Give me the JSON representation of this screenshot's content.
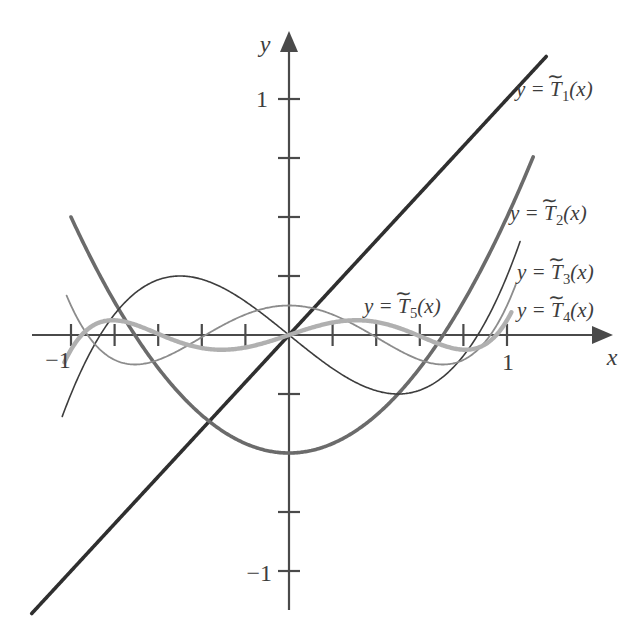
{
  "chart_data": {
    "type": "line",
    "title": "",
    "xlabel": "x",
    "ylabel": "y",
    "xlim": [
      -1.18,
      1.42
    ],
    "ylim": [
      -1.25,
      1.25
    ],
    "grid": false,
    "legend_position": "inline-right",
    "x_ticks": [
      -1,
      -0.8,
      -0.6,
      -0.4,
      -0.2,
      0.2,
      0.4,
      0.6,
      0.8,
      1
    ],
    "x_tick_labels": [
      "-1",
      "",
      "",
      "",
      "",
      "",
      "",
      "",
      "",
      "1"
    ],
    "y_ticks": [
      -1,
      -0.75,
      -0.5,
      -0.25,
      0.25,
      0.5,
      0.75,
      1
    ],
    "y_tick_labels": [
      "−1",
      "",
      "",
      "",
      "",
      "",
      "",
      "1"
    ],
    "series": [
      {
        "name": "T1",
        "label": "y = T̃1(x)",
        "formula": "x",
        "color": "#2f2f2f",
        "width": 3.6,
        "domain": [
          -1.18,
          1.18
        ]
      },
      {
        "name": "T2",
        "label": "y = T̃2(x)",
        "formula": "x^2 - 1/2",
        "color": "#6b6b6b",
        "width": 3.6,
        "domain": [
          -1,
          1.12
        ]
      },
      {
        "name": "T3",
        "label": "y = T̃3(x)",
        "formula": "x^3 - (3/4)x",
        "color": "#3d3d3d",
        "width": 1.6,
        "domain": [
          -1.04,
          1.06
        ]
      },
      {
        "name": "T4",
        "label": "y = T̃4(x)",
        "formula": "x^4 - x^2 + 1/8",
        "color": "#8c8c8c",
        "width": 1.8,
        "domain": [
          -1.02,
          1.04
        ]
      },
      {
        "name": "T5",
        "label": "y = T̃5(x)",
        "formula": "x^5 - (5/4)x^3 + (5/16)x",
        "color": "#b0b0b0",
        "width": 4.4,
        "domain": [
          -1.03,
          1.02
        ]
      }
    ]
  },
  "labels": {
    "t1": {
      "y_eq": "y =",
      "t": "T",
      "tilde": "∼",
      "sub": "1",
      "arg": "(x)"
    },
    "t2": {
      "y_eq": "y =",
      "t": "T",
      "tilde": "∼",
      "sub": "2",
      "arg": "(x)"
    },
    "t3": {
      "y_eq": "y =",
      "t": "T",
      "tilde": "∼",
      "sub": "3",
      "arg": "(x)"
    },
    "t4": {
      "y_eq": "y =",
      "t": "T",
      "tilde": "∼",
      "sub": "4",
      "arg": "(x)"
    },
    "t5": {
      "y_eq": "y =",
      "t": "T",
      "tilde": "∼",
      "sub": "5",
      "arg": "(x)"
    }
  },
  "axes": {
    "x_name": "x",
    "y_name": "y",
    "x_tick_neg1": "−1",
    "x_tick_pos1": "1",
    "y_tick_neg1": "−1",
    "y_tick_pos1": "1"
  }
}
